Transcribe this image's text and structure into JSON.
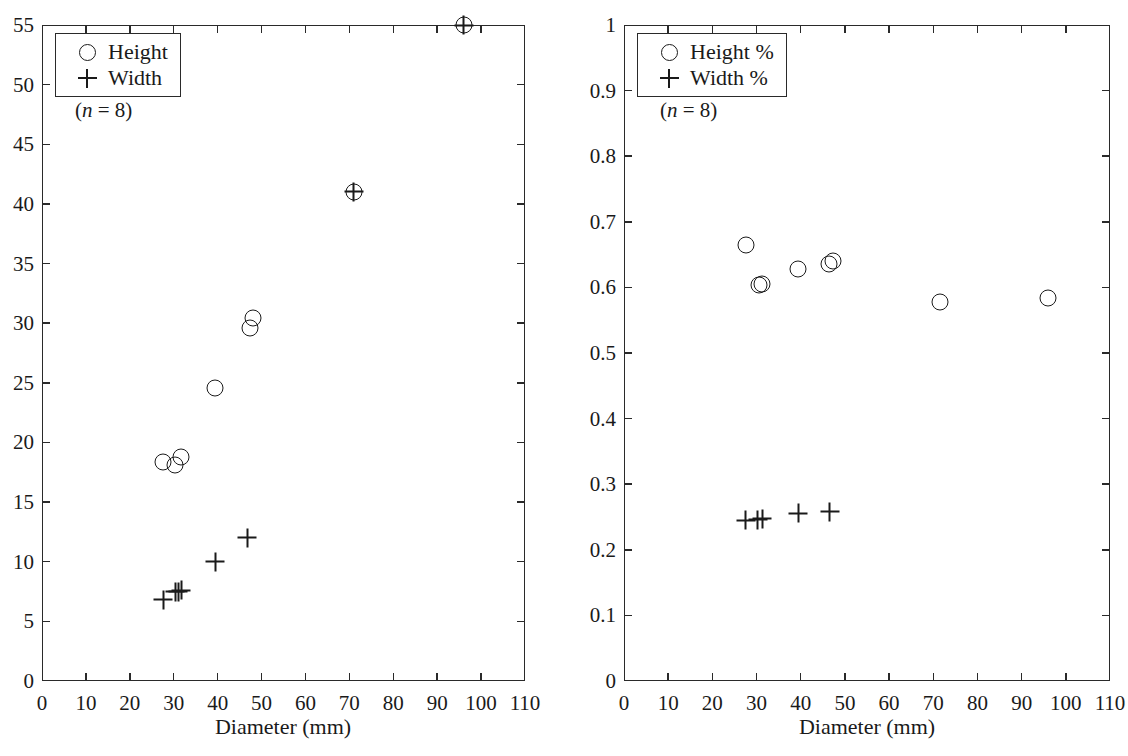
{
  "chart_data": [
    {
      "type": "scatter",
      "panel": "left",
      "title": "",
      "xlabel": "Diameter (mm)",
      "ylabel": "",
      "xlim": [
        0,
        110
      ],
      "ylim": [
        0,
        55
      ],
      "xticks": [
        0,
        10,
        20,
        30,
        40,
        50,
        60,
        70,
        80,
        90,
        100,
        110
      ],
      "yticks": [
        0,
        5,
        10,
        15,
        20,
        25,
        30,
        35,
        40,
        45,
        50,
        55
      ],
      "xtick_labels": [
        "0",
        "10",
        "20",
        "30",
        "40",
        "50",
        "60",
        "70",
        "80",
        "90",
        "100",
        "110"
      ],
      "ytick_labels": [
        "0",
        "5",
        "10",
        "15",
        "20",
        "25",
        "30",
        "35",
        "40",
        "45",
        "50",
        "55"
      ],
      "grid": false,
      "legend_position": "top-left",
      "annotation": "(n = 8)",
      "series": [
        {
          "name": "Height",
          "marker": "circle",
          "x": [
            27.6,
            30.3,
            31.7,
            39.4,
            47.4,
            48.0,
            71.0,
            96.0
          ],
          "y": [
            18.4,
            18.1,
            18.8,
            24.6,
            29.6,
            30.4,
            41.0,
            55.0
          ]
        },
        {
          "name": "Width",
          "marker": "plus",
          "x": [
            27.6,
            30.3,
            31.7,
            39.4,
            46.8,
            71.0,
            96.0,
            31.0
          ],
          "y": [
            6.8,
            7.5,
            7.6,
            10.0,
            12.0,
            41.0,
            55.0,
            7.5
          ]
        }
      ],
      "visible_points": {
        "Height": [
          [
            27.6,
            18.4
          ],
          [
            30.3,
            18.1
          ],
          [
            31.7,
            18.8
          ],
          [
            39.4,
            24.6
          ],
          [
            47.4,
            29.6
          ],
          [
            48.0,
            30.4
          ],
          [
            71.0,
            41.0
          ],
          [
            96.0,
            55.0
          ]
        ],
        "Width": [
          [
            27.6,
            6.8
          ],
          [
            30.3,
            7.5
          ],
          [
            31.4,
            7.6
          ],
          [
            39.4,
            10.0
          ],
          [
            46.8,
            12.0
          ]
        ]
      }
    },
    {
      "type": "scatter",
      "panel": "right",
      "title": "",
      "xlabel": "Diameter (mm)",
      "ylabel": "",
      "xlim": [
        0,
        110
      ],
      "ylim": [
        0,
        1
      ],
      "xticks": [
        0,
        10,
        20,
        30,
        40,
        50,
        60,
        70,
        80,
        90,
        100,
        110
      ],
      "yticks": [
        0,
        0.1,
        0.2,
        0.3,
        0.4,
        0.5,
        0.6,
        0.7,
        0.8,
        0.9,
        1
      ],
      "xtick_labels": [
        "0",
        "10",
        "20",
        "30",
        "40",
        "50",
        "60",
        "70",
        "80",
        "90",
        "100",
        "110"
      ],
      "ytick_labels": [
        "0",
        "0.1",
        "0.2",
        "0.3",
        "0.4",
        "0.5",
        "0.6",
        "0.7",
        "0.8",
        "0.9",
        "1"
      ],
      "grid": false,
      "legend_position": "top-left",
      "annotation": "(n = 8)",
      "series": [
        {
          "name": "Height %",
          "marker": "circle",
          "x": [
            27.6,
            30.6,
            31.3,
            39.4,
            46.4,
            47.2,
            71.5,
            96.0
          ],
          "y": [
            0.664,
            0.603,
            0.605,
            0.628,
            0.636,
            0.641,
            0.578,
            0.584
          ]
        },
        {
          "name": "Width %",
          "marker": "plus",
          "x": [
            27.6,
            30.3,
            31.3,
            39.4,
            46.6
          ],
          "y": [
            0.245,
            0.246,
            0.247,
            0.256,
            0.258
          ]
        }
      ]
    }
  ],
  "panels": {
    "left": {
      "legend": {
        "entries": [
          {
            "symbol": "circle-marker",
            "label": "Height"
          },
          {
            "symbol": "plus-marker",
            "label": "Width"
          }
        ]
      },
      "note_prefix": "(",
      "note_italic": "n",
      "note_suffix": " = 8)",
      "axis_x_title": "Diameter (mm)"
    },
    "right": {
      "legend": {
        "entries": [
          {
            "symbol": "circle-marker",
            "label": "Height %"
          },
          {
            "symbol": "plus-marker",
            "label": "Width %"
          }
        ]
      },
      "note_prefix": "(",
      "note_italic": "n",
      "note_suffix": " = 8)",
      "axis_x_title": "Diameter (mm)"
    }
  },
  "colors": {
    "axis": "#2a2a2a",
    "marker": "#1a1a1a",
    "background": "#ffffff"
  }
}
